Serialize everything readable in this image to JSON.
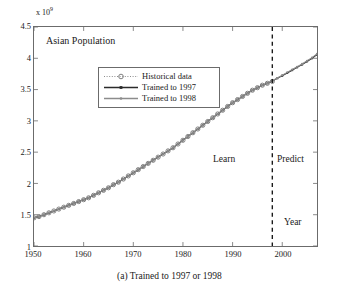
{
  "caption": "(a) Trained to 1997 or 1998",
  "axes": {
    "y_exponent_prefix": "x 10",
    "y_exponent_power": "9",
    "x_ticks": [
      1950,
      1960,
      1970,
      1980,
      1990,
      2000
    ],
    "x_tick_labels": [
      "1950",
      "1960",
      "1970",
      "1980",
      "1990",
      "2000"
    ],
    "y_ticks": [
      1,
      1.5,
      2,
      2.5,
      3,
      3.5,
      4,
      4.5
    ],
    "y_tick_labels": [
      "1",
      "1.5",
      "2",
      "2.5",
      "3",
      "3.5",
      "4",
      "4.5"
    ]
  },
  "annotations": {
    "plot_title": "Asian Population",
    "learn": "Learn",
    "predict": "Predict",
    "year": "Year"
  },
  "legend": {
    "items": [
      {
        "label": "Historical data",
        "style": "dotted-circle",
        "color": "#808080"
      },
      {
        "label": "Trained to 1997",
        "style": "solid-square",
        "color": "#2b2b2b"
      },
      {
        "label": "Trained to 1998",
        "style": "solid-dot",
        "color": "#8c8c8c"
      }
    ]
  },
  "chart_data": {
    "type": "line",
    "title": "Asian Population",
    "xlabel": "Year",
    "ylabel": "",
    "y_scale_factor": 1000000000,
    "y_scale_label": "x 10^9",
    "xlim": [
      1950,
      2007
    ],
    "ylim": [
      1,
      4.5
    ],
    "grid": false,
    "legend_position": "upper-left-inner",
    "divider": {
      "x": 1998,
      "style": "dashed",
      "color": "#1a1a1a",
      "left_region_label": "Learn",
      "right_region_label": "Predict"
    },
    "x": [
      1950,
      1951,
      1952,
      1953,
      1954,
      1955,
      1956,
      1957,
      1958,
      1959,
      1960,
      1961,
      1962,
      1963,
      1964,
      1965,
      1966,
      1967,
      1968,
      1969,
      1970,
      1971,
      1972,
      1973,
      1974,
      1975,
      1976,
      1977,
      1978,
      1979,
      1980,
      1981,
      1982,
      1983,
      1984,
      1985,
      1986,
      1987,
      1988,
      1989,
      1990,
      1991,
      1992,
      1993,
      1994,
      1995,
      1996,
      1997,
      1998,
      1999,
      2000,
      2001,
      2002,
      2003,
      2004,
      2005,
      2006,
      2007
    ],
    "series": [
      {
        "name": "Historical data",
        "style": "dotted",
        "marker": "circle",
        "color": "#808080",
        "values": [
          1.45,
          1.47,
          1.5,
          1.53,
          1.56,
          1.59,
          1.62,
          1.65,
          1.68,
          1.71,
          1.74,
          1.77,
          1.81,
          1.85,
          1.89,
          1.93,
          1.98,
          2.02,
          2.07,
          2.12,
          2.17,
          2.22,
          2.27,
          2.32,
          2.37,
          2.42,
          2.47,
          2.52,
          2.57,
          2.63,
          2.69,
          2.75,
          2.81,
          2.87,
          2.93,
          2.99,
          3.05,
          3.11,
          3.17,
          3.23,
          3.29,
          3.34,
          3.39,
          3.44,
          3.49,
          3.53,
          3.57,
          3.6,
          3.63,
          null,
          null,
          null,
          null,
          null,
          null,
          null,
          null,
          null
        ]
      },
      {
        "name": "Trained to 1997",
        "style": "solid",
        "marker": "square",
        "color": "#2b2b2b",
        "values": [
          1.45,
          1.47,
          1.5,
          1.53,
          1.56,
          1.59,
          1.62,
          1.65,
          1.68,
          1.71,
          1.74,
          1.77,
          1.81,
          1.85,
          1.89,
          1.93,
          1.98,
          2.02,
          2.07,
          2.12,
          2.17,
          2.22,
          2.27,
          2.32,
          2.37,
          2.42,
          2.47,
          2.52,
          2.57,
          2.63,
          2.69,
          2.75,
          2.81,
          2.87,
          2.93,
          2.99,
          3.05,
          3.11,
          3.17,
          3.23,
          3.29,
          3.34,
          3.39,
          3.44,
          3.49,
          3.53,
          3.57,
          3.6,
          3.635,
          3.68,
          3.72,
          3.765,
          3.81,
          3.855,
          3.9,
          3.95,
          4.0,
          4.06
        ]
      },
      {
        "name": "Trained to 1998",
        "style": "solid",
        "marker": "dot",
        "color": "#8c8c8c",
        "values": [
          1.45,
          1.47,
          1.5,
          1.53,
          1.56,
          1.59,
          1.62,
          1.65,
          1.68,
          1.71,
          1.74,
          1.77,
          1.81,
          1.85,
          1.89,
          1.93,
          1.98,
          2.02,
          2.07,
          2.12,
          2.17,
          2.22,
          2.27,
          2.32,
          2.37,
          2.42,
          2.47,
          2.52,
          2.57,
          2.63,
          2.69,
          2.75,
          2.81,
          2.87,
          2.93,
          2.99,
          3.05,
          3.11,
          3.17,
          3.23,
          3.29,
          3.34,
          3.39,
          3.44,
          3.49,
          3.53,
          3.57,
          3.6,
          3.64,
          3.685,
          3.73,
          3.775,
          3.82,
          3.865,
          3.91,
          3.96,
          4.01,
          4.07
        ]
      }
    ]
  }
}
